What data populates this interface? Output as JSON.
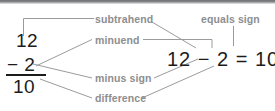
{
  "figure": {
    "colors": {
      "label_gray": "#8d8e90",
      "ink_black": "#1c1c1c",
      "leader_gray": "#9a9b9d",
      "band_dark": "#6e7174",
      "background": "#ffffff"
    }
  },
  "vertical_problem": {
    "minuend": "12",
    "operator_and_subtrahend": "− 2",
    "difference": "10"
  },
  "horizontal_equation": {
    "text": "12 − 2 = 10"
  },
  "labels": {
    "subtrahend": "subtrahend",
    "minuend": "minuend",
    "minus_sign": "minus sign",
    "difference": "difference",
    "equals_sign": "equals sign"
  }
}
